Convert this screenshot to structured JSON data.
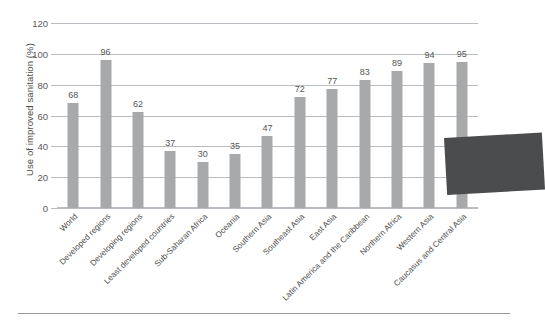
{
  "chart_data": {
    "type": "bar",
    "title": "",
    "subtitle": "",
    "xlabel": "",
    "ylabel": "Use of improved sanitation (%)",
    "ylim": [
      0,
      120
    ],
    "ytick_labels": [
      "0",
      "20",
      "40",
      "60",
      "80",
      "100",
      "120"
    ],
    "yticks": [
      0,
      20,
      40,
      60,
      80,
      100,
      120
    ],
    "grid": true,
    "legend": null,
    "bar_color": "#a7a9ab",
    "gridline_color": "#b9bcc0",
    "categories": [
      "World",
      "Developed regions",
      "Developing regions",
      "Least developed countries",
      "Sub-Saharan Africa",
      "Oceania",
      "Southern Asia",
      "Southeast Asia",
      "East Asia",
      "Latin America and the Caribbean",
      "Northern Africa",
      "Western Asia",
      "Caucasus and Central Asia"
    ],
    "values": [
      68,
      96,
      62,
      37,
      30,
      35,
      47,
      72,
      77,
      83,
      89,
      94,
      95
    ],
    "value_labels": [
      "68",
      "96",
      "62",
      "37",
      "30",
      "35",
      "47",
      "72",
      "77",
      "83",
      "89",
      "94",
      "95"
    ],
    "annotations": [
      {
        "name": "occluding-rectangle",
        "shape": "rotated-rectangle",
        "color": "#4b4c4e",
        "note": "dark grey rectangle overlapping lower-right of plot area"
      }
    ]
  },
  "figure": {
    "footer_rule_color": "#9a9a9a"
  }
}
